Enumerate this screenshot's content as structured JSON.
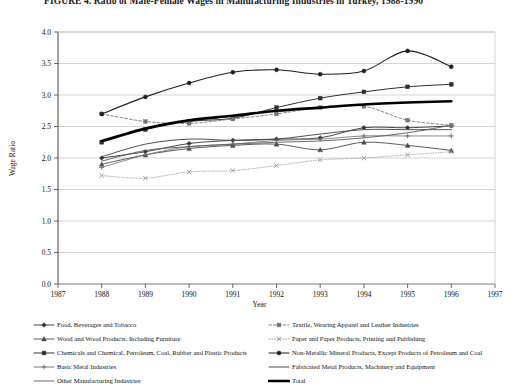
{
  "figure": {
    "title": "FIGURE 4. Ratio of Male-Female Wages in Manufacturing Industries in Turkey, 1988-1996"
  },
  "chart_data": {
    "type": "line",
    "title": "",
    "xlabel": "Year",
    "ylabel": "Wage Ratio",
    "x": [
      1988,
      1989,
      1990,
      1991,
      1992,
      1993,
      1994,
      1995,
      1996
    ],
    "xlim": [
      1987,
      1997
    ],
    "ylim": [
      0.0,
      4.0
    ],
    "ytick_labels": [
      "0.0",
      "0.5",
      "1.0",
      "1.5",
      "2.0",
      "2.5",
      "3.0",
      "3.5",
      "4.0"
    ],
    "yticks": [
      0.0,
      0.5,
      1.0,
      1.5,
      2.0,
      2.5,
      3.0,
      3.5,
      4.0
    ],
    "xtick_labels": [
      "1987",
      "1988",
      "1989",
      "1990",
      "1991",
      "1992",
      "1993",
      "1994",
      "1995",
      "1996",
      "1997"
    ],
    "xticks": [
      1987,
      1988,
      1989,
      1990,
      1991,
      1992,
      1993,
      1994,
      1995,
      1996,
      1997
    ],
    "grid": true,
    "grid_axis": "y",
    "legend_position": "bottom",
    "series": [
      {
        "name": "Food, Beverages and Tobacco",
        "marker": "diamond",
        "dash": "none",
        "color": "#333333",
        "width": 0.9,
        "values": [
          2.0,
          2.1,
          2.23,
          2.28,
          2.3,
          2.32,
          2.48,
          2.48,
          2.51
        ]
      },
      {
        "name": "Wood and Wood Products, Including Furniture",
        "marker": "triangle",
        "dash": "none",
        "color": "#4a4a4a",
        "width": 0.9,
        "values": [
          1.9,
          2.05,
          2.15,
          2.2,
          2.22,
          2.13,
          2.25,
          2.2,
          2.12
        ]
      },
      {
        "name": "Chemicals and Chemical, Petroleum, Coal, Rubber and Plastic Products",
        "marker": "square",
        "dash": "none",
        "color": "#2e2e2e",
        "width": 1.0,
        "values": [
          2.25,
          2.45,
          2.58,
          2.63,
          2.8,
          2.95,
          3.05,
          3.13,
          3.17
        ]
      },
      {
        "name": "Basic Metal Industries",
        "marker": "plus",
        "dash": "none",
        "color": "#6d6d6d",
        "width": 0.8,
        "values": [
          1.85,
          2.05,
          2.18,
          2.22,
          2.28,
          2.3,
          2.35,
          2.35,
          2.35
        ]
      },
      {
        "name": "Other Manufacturing Industries",
        "marker": "none",
        "dash": "none",
        "color": "#5a5a5a",
        "width": 0.9,
        "values": [
          1.95,
          2.12,
          2.18,
          2.22,
          2.25,
          2.27,
          2.32,
          2.4,
          2.52
        ]
      },
      {
        "name": "Textile, Wearing Apparel and Leather Industries",
        "marker": "square",
        "dash": "dashed",
        "color": "#757575",
        "width": 0.9,
        "values": [
          2.7,
          2.58,
          2.55,
          2.62,
          2.7,
          2.8,
          2.82,
          2.6,
          2.52
        ]
      },
      {
        "name": "Paper and Paper Products, Printing and Publishing",
        "marker": "cross",
        "dash": "dotted",
        "color": "#9a9a9a",
        "width": 0.8,
        "values": [
          1.72,
          1.68,
          1.78,
          1.8,
          1.88,
          1.97,
          2.0,
          2.05,
          2.1
        ]
      },
      {
        "name": "Non-Metallic Mineral Products, Except Products of Petroleum and Coal",
        "marker": "circle",
        "dash": "none",
        "color": "#1f1f1f",
        "width": 1.1,
        "values": [
          2.7,
          2.97,
          3.19,
          3.36,
          3.4,
          3.33,
          3.38,
          3.7,
          3.45
        ]
      },
      {
        "name": "Fabricated Metal Products, Machinery and Equipment",
        "marker": "none",
        "dash": "none",
        "color": "#4f4f4f",
        "width": 1.0,
        "values": [
          2.02,
          2.22,
          2.3,
          2.28,
          2.3,
          2.38,
          2.45,
          2.45,
          2.45
        ]
      },
      {
        "name": "Total",
        "marker": "none",
        "dash": "none",
        "color": "#000000",
        "width": 2.6,
        "values": [
          2.27,
          2.47,
          2.6,
          2.67,
          2.75,
          2.8,
          2.85,
          2.88,
          2.9
        ]
      }
    ]
  },
  "legend": {
    "left_items": [
      "Food, Beverages and Tobacco",
      "Wood and Wood Products, Including Furniture",
      "Chemicals and Chemical, Petroleum, Coal, Rubber and Plastic Products",
      "Basic Metal Industries",
      "Other Manufacturing Industries"
    ],
    "right_items": [
      "Textile, Wearing Apparel and Leather Industries",
      "Paper and Paper Products, Printing and Publishing",
      "Non-Metallic Mineral Products, Except Products of Petroleum and Coal",
      "Fabricated Metal Products, Machinery and Equipment",
      "Total"
    ]
  }
}
